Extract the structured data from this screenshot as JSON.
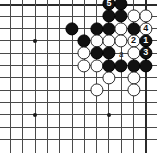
{
  "board": {
    "type": "go-board-diagram",
    "cols": 12,
    "rows": 12,
    "origin_x": 10.5,
    "origin_y": 4.0,
    "spacing": 12.3,
    "stone_radius": 6.6,
    "colors": {
      "line": "#4a4a4a",
      "edge": "#2b2b2b",
      "black_stone": "#111111",
      "white_stone": "#ffffff",
      "background": "#ffffff"
    },
    "hoshi": [
      {
        "c": 2,
        "r": 3
      },
      {
        "c": 2,
        "r": 9
      },
      {
        "c": 8,
        "r": 9
      }
    ],
    "stones": [
      {
        "c": 5,
        "r": 2,
        "color": "black",
        "label": ""
      },
      {
        "c": 8,
        "r": 0,
        "color": "black",
        "label": "5"
      },
      {
        "c": 9,
        "r": 0,
        "color": "black",
        "label": ""
      },
      {
        "c": 8,
        "r": 1,
        "color": "black",
        "label": ""
      },
      {
        "c": 9,
        "r": 1,
        "color": "black",
        "label": ""
      },
      {
        "c": 10,
        "r": 1,
        "color": "white",
        "label": ""
      },
      {
        "c": 11,
        "r": 1,
        "color": "white",
        "label": ""
      },
      {
        "c": 7,
        "r": 2,
        "color": "black",
        "label": ""
      },
      {
        "c": 8,
        "r": 2,
        "color": "black",
        "label": ""
      },
      {
        "c": 9,
        "r": 2,
        "color": "white",
        "label": ""
      },
      {
        "c": 10,
        "r": 2,
        "color": "black",
        "label": ""
      },
      {
        "c": 11,
        "r": 2,
        "color": "white",
        "label": "4"
      },
      {
        "c": 6,
        "r": 3,
        "color": "black",
        "label": ""
      },
      {
        "c": 7,
        "r": 3,
        "color": "white",
        "label": ""
      },
      {
        "c": 8,
        "r": 3,
        "color": "white",
        "label": ""
      },
      {
        "c": 9,
        "r": 3,
        "color": "white",
        "label": ""
      },
      {
        "c": 10,
        "r": 3,
        "color": "white",
        "label": "2"
      },
      {
        "c": 11,
        "r": 3,
        "color": "black",
        "label": "1"
      },
      {
        "c": 6,
        "r": 4,
        "color": "white",
        "label": ""
      },
      {
        "c": 7,
        "r": 4,
        "color": "black",
        "label": ""
      },
      {
        "c": 8,
        "r": 4,
        "color": "black",
        "label": ""
      },
      {
        "c": 10,
        "r": 4,
        "color": "white",
        "label": ""
      },
      {
        "c": 11,
        "r": 4,
        "color": "black",
        "label": "3"
      },
      {
        "c": 6,
        "r": 5,
        "color": "white",
        "label": ""
      },
      {
        "c": 7,
        "r": 5,
        "color": "white",
        "label": ""
      },
      {
        "c": 8,
        "r": 5,
        "color": "black",
        "label": ""
      },
      {
        "c": 9,
        "r": 5,
        "color": "black",
        "label": ""
      },
      {
        "c": 10,
        "r": 5,
        "color": "black",
        "label": ""
      },
      {
        "c": 11,
        "r": 5,
        "color": "black",
        "label": ""
      },
      {
        "c": 8,
        "r": 6,
        "color": "white",
        "label": ""
      },
      {
        "c": 10,
        "r": 6,
        "color": "white",
        "label": ""
      },
      {
        "c": 7,
        "r": 7,
        "color": "white",
        "label": ""
      },
      {
        "c": 10,
        "r": 7,
        "color": "white",
        "label": ""
      }
    ],
    "markers": [
      {
        "c": 9,
        "r": 4,
        "text": "a"
      }
    ],
    "move_labels": [
      "1",
      "2",
      "3",
      "4",
      "5"
    ],
    "point_label": "a"
  }
}
